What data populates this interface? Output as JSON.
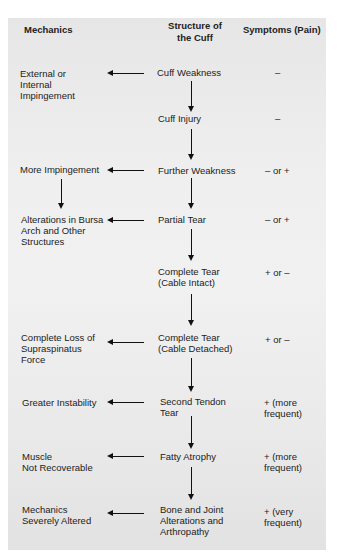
{
  "headers": {
    "mechanics": "Mechanics",
    "structure": "Structure of\nthe Cuff",
    "symptoms": "Symptoms (Pain)"
  },
  "rows": [
    {
      "structure": "Cuff Weakness",
      "mechanics": "External or\nInternal\nImpingement",
      "symptoms": "–"
    },
    {
      "structure": "Cuff Injury",
      "mechanics": "",
      "symptoms": "–"
    },
    {
      "structure": "Further Weakness",
      "mechanics": "More Impingement",
      "symptoms": "–  or  +"
    },
    {
      "structure": "Partial Tear",
      "mechanics": "Alterations in Bursa\nArch and Other\nStructures",
      "symptoms": "–  or  +"
    },
    {
      "structure": "Complete Tear\n(Cable Intact)",
      "mechanics": "",
      "symptoms": "+  or  –"
    },
    {
      "structure": "Complete Tear\n(Cable Detached)",
      "mechanics": "Complete Loss of\nSupraspinatus\nForce",
      "symptoms": "+  or  –"
    },
    {
      "structure": "Second Tendon\nTear",
      "mechanics": "Greater Instability",
      "symptoms": "+  (more\nfrequent)"
    },
    {
      "structure": "Fatty Atrophy",
      "mechanics": "Muscle\nNot Recoverable",
      "symptoms": "+  (more\nfrequent)"
    },
    {
      "structure": "Bone and Joint\nAlterations and\nArthropathy",
      "mechanics": "Mechanics\nSeverely Altered",
      "symptoms": "+  (very\nfrequent)"
    }
  ],
  "colors": {
    "panel_background": "#ececec",
    "arrow": "#111111",
    "text": "#222222"
  }
}
